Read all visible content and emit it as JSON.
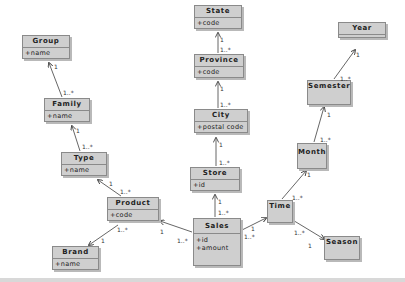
{
  "diagram": {
    "type": "uml-class-diagram",
    "classes": [
      {
        "id": "group",
        "name": "Group",
        "attributes": [
          "+name"
        ]
      },
      {
        "id": "family",
        "name": "Family",
        "attributes": [
          "+name"
        ]
      },
      {
        "id": "type",
        "name": "Type",
        "attributes": [
          "+name"
        ]
      },
      {
        "id": "product",
        "name": "Product",
        "attributes": [
          "+code"
        ]
      },
      {
        "id": "brand",
        "name": "Brand",
        "attributes": [
          "+name"
        ]
      },
      {
        "id": "state",
        "name": "State",
        "attributes": [
          "+code"
        ]
      },
      {
        "id": "province",
        "name": "Province",
        "attributes": [
          "+code"
        ]
      },
      {
        "id": "city",
        "name": "City",
        "attributes": [
          "+postal code"
        ]
      },
      {
        "id": "store",
        "name": "Store",
        "attributes": [
          "+id"
        ]
      },
      {
        "id": "sales",
        "name": "Sales",
        "attributes": [
          "+id",
          "+amount"
        ]
      },
      {
        "id": "time",
        "name": "Time",
        "attributes": []
      },
      {
        "id": "season",
        "name": "Season",
        "attributes": []
      },
      {
        "id": "month",
        "name": "Month",
        "attributes": []
      },
      {
        "id": "semester",
        "name": "Semester",
        "attributes": []
      },
      {
        "id": "year",
        "name": "Year",
        "attributes": []
      }
    ],
    "associations": [
      {
        "from": "family",
        "to": "group",
        "from_mult": "1..*",
        "to_mult": "1"
      },
      {
        "from": "type",
        "to": "family",
        "from_mult": "1..*",
        "to_mult": "1"
      },
      {
        "from": "product",
        "to": "type",
        "from_mult": "1..*",
        "to_mult": "1"
      },
      {
        "from": "product",
        "to": "brand",
        "from_mult": "1..*",
        "to_mult": "1"
      },
      {
        "from": "sales",
        "to": "product",
        "from_mult": "1..*",
        "to_mult": "1"
      },
      {
        "from": "province",
        "to": "state",
        "from_mult": "1..*",
        "to_mult": "1"
      },
      {
        "from": "city",
        "to": "province",
        "from_mult": "1..*",
        "to_mult": "1"
      },
      {
        "from": "store",
        "to": "city",
        "from_mult": "1..*",
        "to_mult": "1"
      },
      {
        "from": "sales",
        "to": "store",
        "from_mult": "1..*",
        "to_mult": "1"
      },
      {
        "from": "sales",
        "to": "time",
        "from_mult": "1..*",
        "to_mult": "1"
      },
      {
        "from": "time",
        "to": "month",
        "from_mult": "1..*",
        "to_mult": "1"
      },
      {
        "from": "month",
        "to": "semester",
        "from_mult": "1..*",
        "to_mult": "1"
      },
      {
        "from": "semester",
        "to": "year",
        "from_mult": "1..*",
        "to_mult": "1"
      },
      {
        "from": "time",
        "to": "season",
        "from_mult": "1..*",
        "to_mult": "1"
      }
    ]
  },
  "labels": {
    "one": "1",
    "many": "1..*"
  },
  "colors": {
    "box_fill": "#cfcfcf",
    "box_border": "#8a8a8a",
    "line": "#555555"
  }
}
